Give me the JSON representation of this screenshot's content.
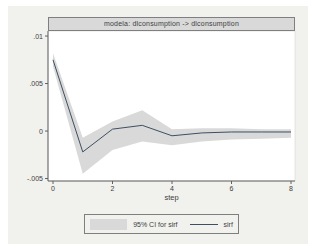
{
  "graph": {
    "background": "#f1f1ee",
    "plot_background": "#ffffff"
  },
  "chart_data": {
    "type": "line",
    "title": "modela: dlconsumption -> dlconsumption",
    "xlabel": "step",
    "x": [
      0,
      1,
      2,
      3,
      4,
      5,
      6,
      7,
      8
    ],
    "xlim": [
      0,
      8
    ],
    "ylim": [
      -0.00526,
      0.01053
    ],
    "xticks": {
      "values": [
        0,
        2,
        4,
        6,
        8
      ],
      "labels": [
        "0",
        "2",
        "4",
        "6",
        "8"
      ]
    },
    "yticks": {
      "values": [
        0.01,
        0.005,
        0,
        -0.005
      ],
      "labels": [
        ".01",
        ".005",
        "0",
        "-.005"
      ]
    },
    "grid": false,
    "series": [
      {
        "name": "sirf",
        "kind": "line",
        "color": "#3d4f63",
        "values": [
          0.0075,
          -0.0022,
          0.0002,
          0.0006,
          -0.0005,
          -0.0002,
          -0.0001,
          -0.0001,
          -0.0001
        ]
      },
      {
        "name": "95% CI for sirf",
        "kind": "band",
        "color": "#d9d9d9",
        "lower": [
          0.0068,
          -0.0045,
          -0.002,
          -0.0011,
          -0.0015,
          -0.0011,
          -0.0009,
          -0.0008,
          -0.0007
        ],
        "upper": [
          0.0082,
          -0.0007,
          0.001,
          0.0022,
          0.0002,
          0.0003,
          0.0003,
          0.0002,
          0.0002
        ]
      }
    ],
    "legend": {
      "position": "bottom",
      "entries": [
        {
          "label": "95% CI for sirf",
          "swatch": "band"
        },
        {
          "label": "sirf",
          "swatch": "line"
        }
      ]
    }
  },
  "colors": {
    "title_bar_fill": "#d9d9d9",
    "title_bar_border": "#7f7f7f",
    "axis": "#606060",
    "text": "#3d3d3d",
    "ci_band": "#d9d9d9",
    "sirf_line": "#3d4f63",
    "legend_border": "#7f7f7f",
    "plot_border": "#cfcfcc"
  }
}
